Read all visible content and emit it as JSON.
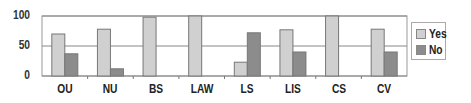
{
  "chart_data": {
    "type": "bar",
    "title": "",
    "xlabel": "",
    "ylabel": "",
    "ylim": [
      0,
      100
    ],
    "yticks": [
      0,
      50,
      100
    ],
    "grid": true,
    "legend_position": "right",
    "categories": [
      "OU",
      "NU",
      "BS",
      "LAW",
      "LS",
      "LIS",
      "CS",
      "CV"
    ],
    "series": [
      {
        "name": "Yes",
        "color": "#d0d0d0",
        "values": [
          70,
          78,
          98,
          100,
          23,
          77,
          100,
          78
        ]
      },
      {
        "name": "No",
        "color": "#8c8c8c",
        "values": [
          37,
          12,
          0,
          0,
          72,
          40,
          0,
          40
        ]
      }
    ]
  },
  "legend": {
    "items": [
      {
        "label": "Yes",
        "color": "#d0d0d0"
      },
      {
        "label": "No",
        "color": "#8c8c8c"
      }
    ]
  }
}
